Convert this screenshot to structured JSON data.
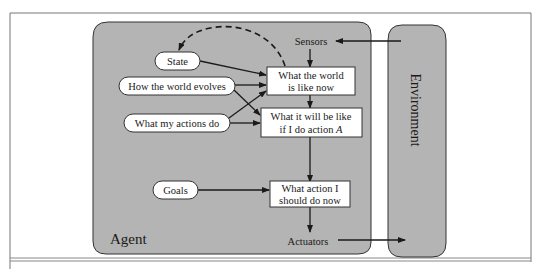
{
  "diagram": {
    "type": "model-based goal-based agent",
    "agent": {
      "label": "Agent"
    },
    "environment": {
      "label": "Environment"
    },
    "ports": {
      "sensors": "Sensors",
      "actuators": "Actuators"
    },
    "knowledge": {
      "state": "State",
      "world_evolves": "How the world evolves",
      "actions_do": "What my actions do",
      "goals": "Goals"
    },
    "process": {
      "world_now_line1": "What the world",
      "world_now_line2": "is like now",
      "will_be_line1": "What it will be like",
      "will_be_line2_prefix": "if I do action ",
      "will_be_line2_var": "A",
      "action_line1": "What action I",
      "action_line2": "should do now"
    },
    "colors": {
      "agent_fill": "#b4b4b4",
      "environment_fill": "#b4b4b4",
      "node_fill": "#ffffff",
      "stroke": "#1a1a1a",
      "frame": "#888888"
    },
    "edges": [
      {
        "from": "sensors",
        "to": "world_now"
      },
      {
        "from": "environment",
        "to": "sensors"
      },
      {
        "from": "state",
        "to": "world_now"
      },
      {
        "from": "world_evolves",
        "to": "world_now"
      },
      {
        "from": "world_evolves",
        "to": "will_be"
      },
      {
        "from": "actions_do",
        "to": "world_now"
      },
      {
        "from": "actions_do",
        "to": "will_be"
      },
      {
        "from": "world_now",
        "to": "will_be"
      },
      {
        "from": "will_be",
        "to": "action"
      },
      {
        "from": "goals",
        "to": "action"
      },
      {
        "from": "action",
        "to": "actuators"
      },
      {
        "from": "actuators",
        "to": "environment"
      },
      {
        "from": "world_now",
        "to": "state",
        "style": "dashed"
      }
    ]
  }
}
